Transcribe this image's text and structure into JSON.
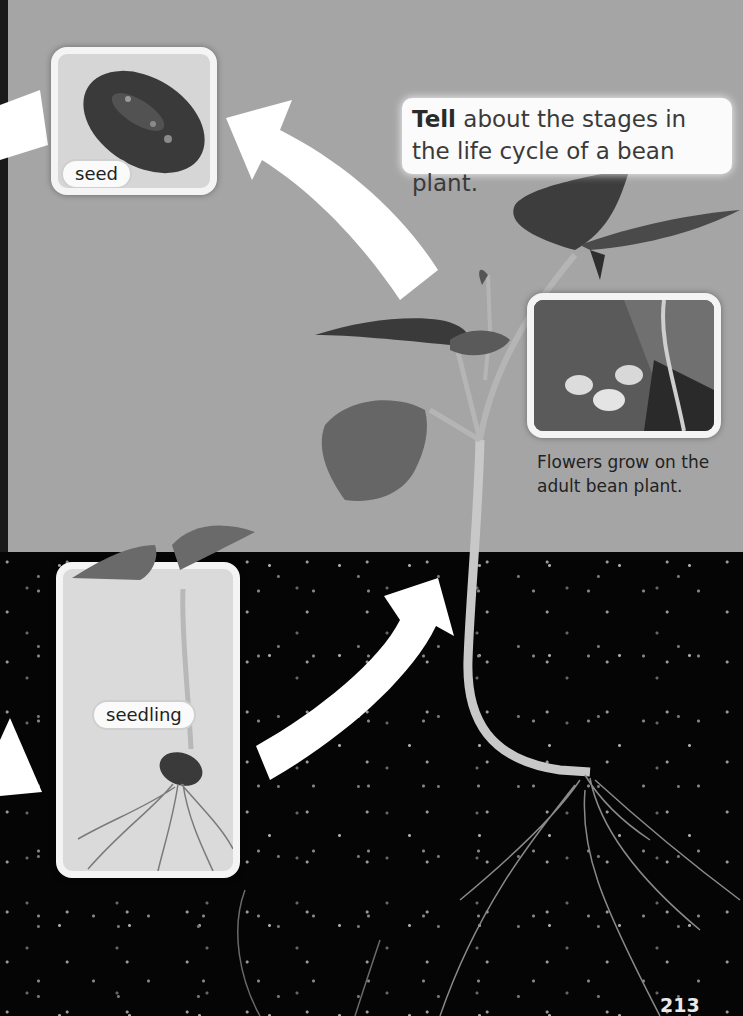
{
  "page": {
    "number": "213",
    "background": {
      "upper": "#a5a5a5",
      "soil": "#050505"
    }
  },
  "callout": {
    "bold": "Tell",
    "text": " about the stages in the life cycle of a bean plant."
  },
  "stages": [
    {
      "label": "seed",
      "image": "bean-seed-photo"
    },
    {
      "label": "seedling",
      "image": "bean-seedling-photo"
    },
    {
      "label": "adult bean plant",
      "image": "adult-bean-plant-photo"
    }
  ],
  "flower_inset": {
    "image": "bean-flowers-photo",
    "caption": "Flowers grow on the adult bean plant."
  },
  "arrows": [
    {
      "name": "arrow-to-seed-left",
      "direction": "right"
    },
    {
      "name": "arrow-plant-to-seed",
      "direction": "up-left"
    },
    {
      "name": "arrow-to-seedling-left",
      "direction": "down-right"
    },
    {
      "name": "arrow-seedling-to-plant",
      "direction": "up-right"
    }
  ]
}
